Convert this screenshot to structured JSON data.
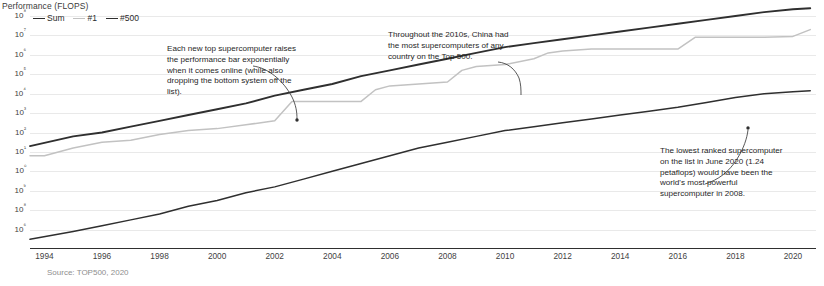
{
  "axis_title": "Performance (FLOPS)",
  "source_note": "Source: TOP500, 2020",
  "legend": {
    "items": [
      {
        "label": "Sum",
        "color": "#2f2f2f"
      },
      {
        "label": "#1",
        "color": "#c2c2c2"
      },
      {
        "label": "#500",
        "color": "#2f2f2f"
      }
    ]
  },
  "annotations": [
    {
      "id": "annot-0",
      "text": "Each new top supercomputer raises the performance bar exponentially when it comes online (while also dropping the bottom system off the list)."
    },
    {
      "id": "annot-1",
      "text": "Throughout the 2010s, China had the most supercomputers of any country on the Top 500."
    },
    {
      "id": "annot-2",
      "text": "The lowest ranked supercomputer on the list in June 2020 (1.24 petaflops) would have been the world's most powerful supercomputer in 2008."
    }
  ],
  "chart_data": {
    "type": "line",
    "title": "Performance (FLOPS)",
    "xlabel": "",
    "ylabel": "Performance (FLOPS)",
    "yscale": "log",
    "grid": true,
    "legend_position": "top-left",
    "xlim": [
      1993.5,
      2020.8
    ],
    "ylim_exponents": [
      6,
      18
    ],
    "ytick_labels": [
      "10⁸",
      "10⁷",
      "10⁶",
      "10⁵",
      "10⁴",
      "10³",
      "10²",
      "10¹",
      "10⁰",
      "10⁹",
      "10⁸",
      "10⁶"
    ],
    "ytick_exponents": [
      18,
      17,
      16,
      15,
      14,
      13,
      12,
      11,
      10,
      9,
      8,
      7
    ],
    "xtick_labels": [
      "1994",
      "1996",
      "1998",
      "2000",
      "2002",
      "2004",
      "2006",
      "2008",
      "2010",
      "2012",
      "2014",
      "2016",
      "2018",
      "2020"
    ],
    "xticks": [
      1994,
      1996,
      1998,
      2000,
      2002,
      2004,
      2006,
      2008,
      2010,
      2012,
      2014,
      2016,
      2018,
      2020
    ],
    "series": [
      {
        "name": "Sum",
        "color": "#2f2f2f",
        "x": [
          1993.5,
          1995,
          1996,
          1997,
          1998,
          1999,
          2000,
          2001,
          2002,
          2003,
          2004,
          2005,
          2006,
          2007,
          2008,
          2009,
          2010,
          2011,
          2012,
          2013,
          2014,
          2015,
          2016,
          2017,
          2018,
          2019,
          2020,
          2020.6
        ],
        "log_y": [
          11.3,
          11.8,
          12.0,
          12.3,
          12.6,
          12.9,
          13.2,
          13.5,
          13.9,
          14.2,
          14.5,
          14.9,
          15.2,
          15.5,
          15.8,
          16.1,
          16.4,
          16.6,
          16.8,
          17.0,
          17.2,
          17.4,
          17.6,
          17.8,
          18.0,
          18.2,
          18.35,
          18.4
        ]
      },
      {
        "name": "#1",
        "color": "#c2c2c2",
        "x": [
          1993.5,
          1994,
          1995,
          1996,
          1997,
          1998,
          1999,
          2000,
          2001,
          2002,
          2002.6,
          2004,
          2005,
          2005.5,
          2006,
          2007,
          2008,
          2008.5,
          2009,
          2010,
          2011,
          2011.5,
          2012,
          2013,
          2014,
          2015,
          2016,
          2016.6,
          2018,
          2019,
          2020,
          2020.6
        ],
        "log_y": [
          10.8,
          10.8,
          11.2,
          11.5,
          11.6,
          11.9,
          12.1,
          12.2,
          12.4,
          12.6,
          13.6,
          13.6,
          13.6,
          14.2,
          14.4,
          14.5,
          14.6,
          15.2,
          15.4,
          15.5,
          15.8,
          16.1,
          16.2,
          16.3,
          16.3,
          16.3,
          16.3,
          16.9,
          16.9,
          16.9,
          16.95,
          17.3
        ]
      },
      {
        "name": "#500",
        "color": "#2f2f2f",
        "x": [
          1993.5,
          1995,
          1996,
          1997,
          1998,
          1999,
          2000,
          2001,
          2002,
          2003,
          2004,
          2005,
          2006,
          2007,
          2008,
          2009,
          2010,
          2011,
          2012,
          2013,
          2014,
          2015,
          2016,
          2017,
          2018,
          2019,
          2020,
          2020.6
        ],
        "log_y": [
          6.5,
          6.9,
          7.2,
          7.5,
          7.8,
          8.2,
          8.5,
          8.9,
          9.2,
          9.6,
          10.0,
          10.4,
          10.8,
          11.2,
          11.5,
          11.8,
          12.1,
          12.3,
          12.5,
          12.7,
          12.9,
          13.1,
          13.3,
          13.55,
          13.8,
          14.0,
          14.1,
          14.15
        ]
      }
    ],
    "annotations": [
      {
        "text": "Each new top supercomputer raises the performance bar exponentially when it comes online (while also dropping the bottom system off the list).",
        "points_to_year": 2002.6
      },
      {
        "text": "Throughout the 2010s, China had the most supercomputers of any country on the Top 500.",
        "points_to_year": 2011
      },
      {
        "text": "The lowest ranked supercomputer on the list in June 2020 (1.24 petaflops) would have been the world's most powerful supercomputer in 2008.",
        "points_to_year": 2019.6
      }
    ]
  }
}
